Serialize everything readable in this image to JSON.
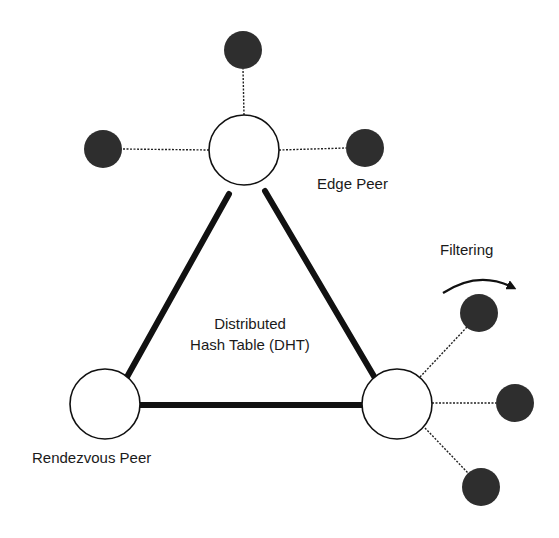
{
  "diagram": {
    "colors": {
      "background": "#ffffff",
      "edge_peer_fill": "#2e2e2e",
      "rendezvous_fill": "#ffffff",
      "stroke": "#111111"
    },
    "labels": {
      "edge_peer": "Edge Peer",
      "rendezvous_peer": "Rendezvous Peer",
      "dht_line1": "Distributed",
      "dht_line2": "Hash Table (DHT)",
      "filtering": "Filtering"
    },
    "rendezvous_peers": [
      {
        "id": "top",
        "cx": 244,
        "cy": 150,
        "r": 35
      },
      {
        "id": "left",
        "cx": 105,
        "cy": 404,
        "r": 35
      },
      {
        "id": "right",
        "cx": 397,
        "cy": 404,
        "r": 35
      }
    ],
    "edge_peers": [
      {
        "id": "top-up",
        "cx": 243,
        "cy": 50,
        "r": 19,
        "parent": "top"
      },
      {
        "id": "top-left",
        "cx": 103,
        "cy": 149,
        "r": 19,
        "parent": "top"
      },
      {
        "id": "top-right",
        "cx": 365,
        "cy": 148,
        "r": 19,
        "parent": "top"
      },
      {
        "id": "right-upper",
        "cx": 479,
        "cy": 313,
        "r": 19,
        "parent": "right"
      },
      {
        "id": "right-middle",
        "cx": 515,
        "cy": 403,
        "r": 19,
        "parent": "right"
      },
      {
        "id": "right-lower",
        "cx": 481,
        "cy": 487,
        "r": 19,
        "parent": "right"
      }
    ],
    "dht_links": [
      {
        "from": "top",
        "to": "left"
      },
      {
        "from": "top",
        "to": "right"
      },
      {
        "from": "left",
        "to": "right"
      }
    ]
  }
}
